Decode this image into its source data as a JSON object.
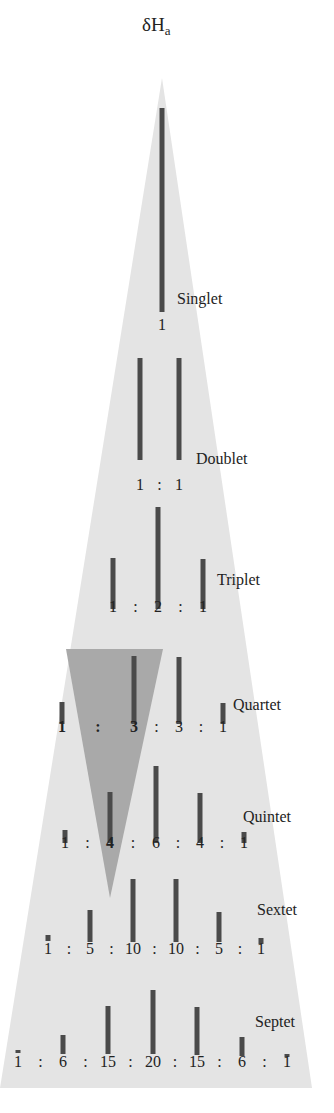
{
  "title": {
    "symbol": "δH",
    "subscript": "a"
  },
  "colors": {
    "background": "#ffffff",
    "big_triangle": "#e4e4e4",
    "highlight_triangle": "#a9a9a9",
    "bar": "#4a4a4a",
    "text": "#222222"
  },
  "big_triangle": {
    "apex": [
      162,
      78
    ],
    "bottom_left": [
      0,
      1088
    ],
    "bottom_right": [
      312,
      1088
    ]
  },
  "highlight_triangle": {
    "top_left": [
      66,
      649
    ],
    "top_right": [
      163,
      649
    ],
    "apex": [
      110,
      898
    ]
  },
  "multiplets": [
    {
      "name": "Singlet",
      "label_pos": [
        177,
        300
      ],
      "ratio_y": 318,
      "peaks": [
        {
          "x": 162,
          "value": "1",
          "top": 108,
          "bottom": 312
        }
      ]
    },
    {
      "name": "Doublet",
      "label_pos": [
        196,
        460
      ],
      "ratio_y": 478,
      "peaks": [
        {
          "x": 140,
          "value": "1",
          "top": 358,
          "bottom": 460
        },
        {
          "x": 179,
          "value": "1",
          "top": 358,
          "bottom": 460
        }
      ]
    },
    {
      "name": "Triplet",
      "label_pos": [
        217,
        581
      ],
      "ratio_y": 600,
      "peaks": [
        {
          "x": 113,
          "value": "1",
          "top": 558,
          "bottom": 609
        },
        {
          "x": 158,
          "value": "2",
          "top": 507,
          "bottom": 609
        },
        {
          "x": 203,
          "value": "1",
          "top": 559,
          "bottom": 609
        }
      ]
    },
    {
      "name": "Quartet",
      "label_pos": [
        233,
        706
      ],
      "ratio_y": 720,
      "peaks": [
        {
          "x": 62,
          "value": "1",
          "top": 702,
          "bottom": 724,
          "bold": true
        },
        {
          "x": 134,
          "value": "3",
          "top": 656,
          "bottom": 724,
          "bold": true
        },
        {
          "x": 179,
          "value": "3",
          "top": 657,
          "bottom": 724
        },
        {
          "x": 223,
          "value": "1",
          "top": 703,
          "bottom": 724
        }
      ]
    },
    {
      "name": "Quintet",
      "label_pos": [
        243,
        818
      ],
      "ratio_y": 836,
      "peaks": [
        {
          "x": 65,
          "value": "1",
          "top": 830,
          "bottom": 843
        },
        {
          "x": 110,
          "value": "4",
          "top": 792,
          "bottom": 843,
          "bold": true
        },
        {
          "x": 156,
          "value": "6",
          "top": 766,
          "bottom": 843
        },
        {
          "x": 200,
          "value": "4",
          "top": 793,
          "bottom": 843
        },
        {
          "x": 244,
          "value": "1",
          "top": 832,
          "bottom": 843
        }
      ]
    },
    {
      "name": "Sextet",
      "label_pos": [
        257,
        911
      ],
      "ratio_y": 942,
      "peaks": [
        {
          "x": 48,
          "value": "1",
          "top": 935,
          "bottom": 941
        },
        {
          "x": 90,
          "value": "5",
          "top": 910,
          "bottom": 942
        },
        {
          "x": 133,
          "value": "10",
          "top": 879,
          "bottom": 942
        },
        {
          "x": 176,
          "value": "10",
          "top": 879,
          "bottom": 942
        },
        {
          "x": 219,
          "value": "5",
          "top": 912,
          "bottom": 942
        },
        {
          "x": 261,
          "value": "1",
          "top": 938,
          "bottom": 944
        }
      ]
    },
    {
      "name": "Septet",
      "label_pos": [
        255,
        1023
      ],
      "ratio_y": 1055,
      "peaks": [
        {
          "x": 18,
          "value": "1",
          "top": 1050,
          "bottom": 1053
        },
        {
          "x": 63,
          "value": "6",
          "top": 1035,
          "bottom": 1054
        },
        {
          "x": 108,
          "value": "15",
          "top": 1006,
          "bottom": 1054
        },
        {
          "x": 153,
          "value": "20",
          "top": 990,
          "bottom": 1054
        },
        {
          "x": 197,
          "value": "15",
          "top": 1007,
          "bottom": 1055
        },
        {
          "x": 242,
          "value": "6",
          "top": 1037,
          "bottom": 1056
        },
        {
          "x": 287,
          "value": "1",
          "top": 1054,
          "bottom": 1056
        }
      ]
    }
  ],
  "separator": ":"
}
